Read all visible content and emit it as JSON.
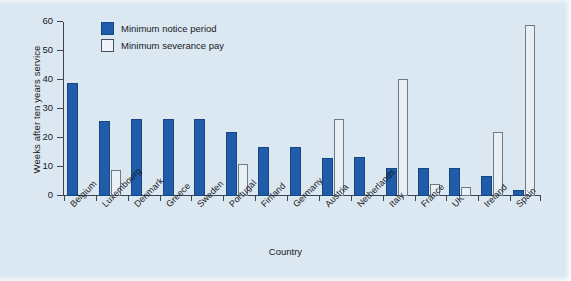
{
  "figure": {
    "background_color": "#dce8f1",
    "plot_background_color": "#dce8f1"
  },
  "legend": {
    "position": "top-left-inside",
    "entries": [
      {
        "label": "Minimum notice period",
        "swatch": "filled-blue-square",
        "color": "#1f5caa"
      },
      {
        "label": "Minimum severance pay",
        "swatch": "hollow-white-square",
        "color": "#e8f0f6"
      }
    ]
  },
  "chart_data": {
    "type": "bar",
    "title": "",
    "xlabel": "Country",
    "ylabel": "Weeks after ten years service",
    "ylim": [
      0,
      60
    ],
    "yticks": [
      0,
      10,
      20,
      30,
      40,
      50,
      60
    ],
    "grid": false,
    "legend_position": "upper left",
    "categories": [
      "Belgium",
      "Luxembourg",
      "Denmark",
      "Greece",
      "Sweden",
      "Portugal",
      "Finland",
      "Germany",
      "Austria",
      "Netherlands",
      "Italy",
      "France",
      "UK",
      "Ireland",
      "Spain"
    ],
    "series": [
      {
        "name": "Minimum notice period",
        "color": "#1f5caa",
        "values": [
          39,
          26,
          26.5,
          26.5,
          26.5,
          22,
          17,
          17,
          13,
          13.5,
          9.5,
          9.5,
          9.5,
          7,
          2
        ]
      },
      {
        "name": "Minimum severance pay",
        "color": "#e8f0f6",
        "values": [
          0,
          9,
          0,
          0,
          0,
          11,
          0,
          0,
          26.5,
          0,
          40.5,
          4,
          3,
          22,
          59
        ]
      }
    ]
  }
}
